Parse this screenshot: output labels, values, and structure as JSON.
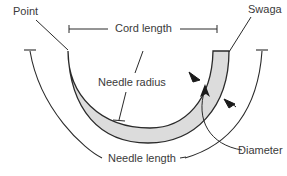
{
  "diagram": {
    "labels": {
      "point": "Point",
      "cord_length": "Cord length",
      "swage": "Swaga",
      "needle_radius": "Needle radius",
      "diameter": "Diameter",
      "needle_length": "Needle length"
    },
    "colors": {
      "stroke": "#2a2a2a",
      "needle_fill": "#dcdcdc",
      "text": "#3a3a3a",
      "background": "#ffffff"
    }
  }
}
